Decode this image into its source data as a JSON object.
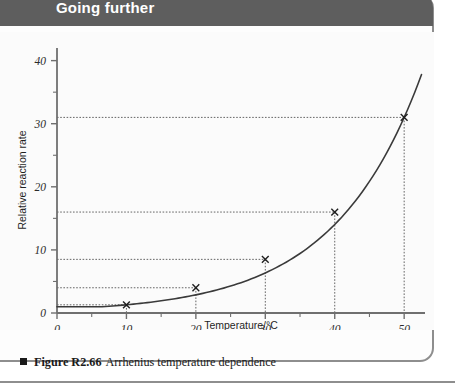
{
  "header": {
    "title": "Going further"
  },
  "caption": {
    "marker": "square-bullet",
    "figure_number": "Figure R2.66",
    "text": "Arrhenius temperature dependence"
  },
  "colors": {
    "banner": "#5e5e5e",
    "frame_border": "#8e8e8e",
    "axis": "#6f6f6f",
    "curve": "#3a3a3a",
    "guide_line": "#555555",
    "plot_background": "#fbfbfb",
    "caption_text": "#1a1a1a",
    "header_text": "#ffffff"
  },
  "chart_data": {
    "type": "line",
    "title": "Arrhenius temperature dependence",
    "xlabel": "Temperature/°C",
    "ylabel": "Relative reaction rate",
    "xlim": [
      0,
      53
    ],
    "ylim": [
      0,
      42
    ],
    "grid": false,
    "legend": "none",
    "x_major_ticks": [
      0,
      10,
      20,
      30,
      40,
      50
    ],
    "x_major_tick_labels": [
      "0",
      "10",
      "20",
      "30",
      "40",
      "50"
    ],
    "x_minor_ticks": [
      5,
      15,
      25,
      35,
      45
    ],
    "y_major_ticks": [
      0,
      10,
      20,
      30,
      40
    ],
    "y_major_tick_labels": [
      "0",
      "10",
      "20",
      "30",
      "40"
    ],
    "y_minor_ticks": [
      5,
      15,
      25,
      35
    ],
    "series": [
      {
        "name": "Relative reaction rate",
        "type": "exponential curve",
        "marker": "cross",
        "x": [
          0,
          10,
          20,
          30,
          40,
          50
        ],
        "y": [
          1.0,
          1.3,
          4.0,
          8.5,
          16.0,
          31.0
        ]
      }
    ],
    "marked_points": [
      {
        "x": 10,
        "y": 1.3
      },
      {
        "x": 20,
        "y": 4.0
      },
      {
        "x": 30,
        "y": 8.5
      },
      {
        "x": 40,
        "y": 16.0
      },
      {
        "x": 50,
        "y": 31.0
      }
    ],
    "curve_extends_to": {
      "x": 52.5,
      "y": 36.0
    },
    "guide_lines": "dotted horizontal to y-axis and dotted vertical to x-axis at each marked point",
    "annotations": []
  }
}
